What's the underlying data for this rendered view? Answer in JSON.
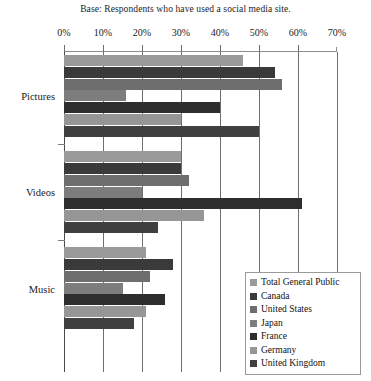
{
  "base_note": "Base: Respondents who have used a social media site.",
  "chart_data": {
    "type": "bar",
    "orientation": "horizontal",
    "grouped": true,
    "title": "",
    "subtitle": "Base: Respondents who have used a social media site.",
    "xlabel": "",
    "ylabel": "",
    "xlim": [
      0,
      70
    ],
    "xticks": [
      0,
      10,
      20,
      30,
      40,
      50,
      60,
      70
    ],
    "xtick_labels": [
      "0%",
      "10%",
      "20%",
      "30%",
      "40%",
      "50%",
      "60%",
      "70%"
    ],
    "grid": true,
    "grid_axis": "x",
    "legend_position": "bottom-right",
    "categories": [
      "Pictures",
      "Videos",
      "Music"
    ],
    "series": [
      {
        "name": "Total General Public",
        "color": "#9a9a9a",
        "values": [
          46,
          30,
          21
        ]
      },
      {
        "name": "Canada",
        "color": "#3a3a3a",
        "values": [
          54,
          30,
          28
        ]
      },
      {
        "name": "United States",
        "color": "#6e6e6e",
        "values": [
          56,
          32,
          22
        ]
      },
      {
        "name": "Japan",
        "color": "#7d7d7d",
        "values": [
          16,
          20,
          15
        ]
      },
      {
        "name": "France",
        "color": "#2e2e2e",
        "values": [
          40,
          61,
          26
        ]
      },
      {
        "name": "Germany",
        "color": "#969696",
        "values": [
          30,
          36,
          21
        ]
      },
      {
        "name": "United Kingdom",
        "color": "#404040",
        "values": [
          50,
          24,
          18
        ]
      }
    ]
  },
  "legend": {
    "items": [
      {
        "label": "Total General Public",
        "color": "#9a9a9a"
      },
      {
        "label": "Canada",
        "color": "#3a3a3a"
      },
      {
        "label": "United States",
        "color": "#6e6e6e"
      },
      {
        "label": "Japan",
        "color": "#7d7d7d"
      },
      {
        "label": "France",
        "color": "#2e2e2e"
      },
      {
        "label": "Germany",
        "color": "#969696"
      },
      {
        "label": "United Kingdom",
        "color": "#404040"
      }
    ]
  }
}
